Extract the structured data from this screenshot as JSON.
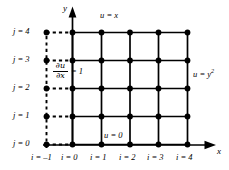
{
  "figure": {
    "type": "finite-difference-grid",
    "background_color": "#ffffff",
    "line_color": "#000000",
    "node_color": "#000000"
  },
  "axes": {
    "x_axis_label": "x",
    "y_axis_label": "y"
  },
  "x_ticks": [
    {
      "label": "i = –1",
      "value": -1
    },
    {
      "label": "i = 0",
      "value": 0
    },
    {
      "label": "i = 1",
      "value": 1
    },
    {
      "label": "i = 2",
      "value": 2
    },
    {
      "label": "i = 3",
      "value": 3
    },
    {
      "label": "i = 4",
      "value": 4
    }
  ],
  "y_ticks": [
    {
      "label": "j = 0",
      "value": 0
    },
    {
      "label": "j = 1",
      "value": 1
    },
    {
      "label": "j = 2",
      "value": 2
    },
    {
      "label": "j = 3",
      "value": 3
    },
    {
      "label": "j = 4",
      "value": 4
    }
  ],
  "boundary_conditions": {
    "top": "u = x",
    "bottom": "u = 0",
    "right_main": "u = y",
    "right_exponent": "2",
    "left_numerator": "∂u",
    "left_denominator": "∂x",
    "left_equals": "= 1"
  },
  "grid": {
    "columns": 5,
    "rows": 5,
    "ghost_column_index": -1,
    "ghost_line_style": "dashed",
    "main_line_style": "solid",
    "node_radius_px": 2.6
  }
}
